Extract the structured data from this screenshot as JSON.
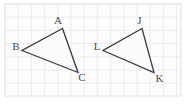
{
  "figure": {
    "canvas": {
      "width": 193,
      "height": 104
    },
    "background_color": "#ffffff",
    "frame": {
      "x": 5,
      "y": 4,
      "width": 176,
      "height": 92,
      "stroke": "#e2e2e6",
      "fill": "#fdfdfd"
    },
    "grid": {
      "visible": true,
      "spacing": 13.2,
      "color": "#ebebf0",
      "x_start": 5,
      "y_start": 4,
      "x_end": 181,
      "y_end": 96
    },
    "stroke_color": "#3a3a3a",
    "stroke_width": 1.3,
    "fill_color": "#fbfbfb",
    "label_color": "#4a4a4a",
    "label_font_size": 11,
    "triangles": [
      {
        "name": "triangle-abc",
        "vertices": [
          {
            "label": "A",
            "x": 62.5,
            "y": 28.5,
            "label_x": 58.0,
            "label_y": 24.0,
            "label_anchor": "middle"
          },
          {
            "label": "B",
            "x": 22.0,
            "y": 50.5,
            "label_x": 16.0,
            "label_y": 50.0,
            "label_anchor": "middle"
          },
          {
            "label": "C",
            "x": 78.0,
            "y": 72.5,
            "label_x": 82.0,
            "label_y": 81.0,
            "label_anchor": "middle"
          }
        ]
      },
      {
        "name": "triangle-jlk",
        "vertices": [
          {
            "label": "J",
            "x": 142.0,
            "y": 28.5,
            "label_x": 139.5,
            "label_y": 23.5,
            "label_anchor": "middle"
          },
          {
            "label": "L",
            "x": 103.0,
            "y": 50.5,
            "label_x": 97.0,
            "label_y": 49.5,
            "label_anchor": "middle"
          },
          {
            "label": "K",
            "x": 154.0,
            "y": 72.5,
            "label_x": 159.5,
            "label_y": 82.0,
            "label_anchor": "middle"
          }
        ]
      }
    ]
  }
}
